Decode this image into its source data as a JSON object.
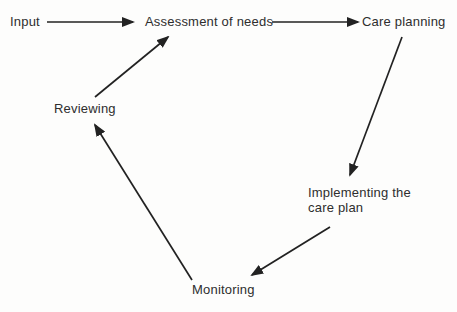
{
  "diagram": {
    "type": "cyclic-flow-diagram",
    "nodes": {
      "input": {
        "label": "Input"
      },
      "assessment": {
        "label": "Assessment of needs"
      },
      "care_planning": {
        "label": "Care planning"
      },
      "implementing": {
        "label": "Implementing the care plan"
      },
      "monitoring": {
        "label": "Monitoring"
      },
      "reviewing": {
        "label": "Reviewing"
      }
    },
    "edges": [
      {
        "from": "input",
        "to": "assessment"
      },
      {
        "from": "assessment",
        "to": "care_planning"
      },
      {
        "from": "care_planning",
        "to": "implementing"
      },
      {
        "from": "implementing",
        "to": "monitoring"
      },
      {
        "from": "monitoring",
        "to": "reviewing"
      },
      {
        "from": "reviewing",
        "to": "assessment"
      }
    ],
    "colors": {
      "background": "#fdfdfc",
      "text": "#2e2e2e",
      "arrow": "#222222"
    }
  }
}
